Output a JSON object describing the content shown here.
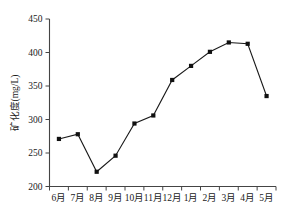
{
  "chart_data": {
    "type": "line",
    "title": "",
    "subtitle": "",
    "xlabel": "",
    "ylabel": "矿化度(mg/L)",
    "categories": [
      "6月",
      "7月",
      "8月",
      "9月",
      "10月",
      "11月",
      "12月",
      "1月",
      "2月",
      "3月",
      "4月",
      "5月"
    ],
    "values": [
      271,
      278,
      222,
      246,
      294,
      306,
      359,
      380,
      401,
      415,
      413,
      335
    ],
    "series": [
      {
        "name": "矿化度",
        "values": [
          271,
          278,
          222,
          246,
          294,
          306,
          359,
          380,
          401,
          415,
          413,
          335
        ]
      }
    ],
    "ylim": [
      200,
      450
    ],
    "ytick_labels": [
      "200",
      "250",
      "300",
      "350",
      "400",
      "450"
    ],
    "ytick_values": [
      200,
      250,
      300,
      350,
      400,
      450
    ],
    "grid": false,
    "legend": false,
    "legend_position": "none",
    "marker": "square",
    "line_color": "#1a1a1a",
    "marker_color": "#111111",
    "axis_color": "#444444",
    "background_color": "#ffffff"
  }
}
